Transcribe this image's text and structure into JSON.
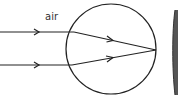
{
  "diagram": {
    "label_medium": "air",
    "colors": {
      "stroke": "#222222",
      "background": "#ffffff",
      "screen": "#555555"
    },
    "sphere": {
      "cx": 111,
      "cy": 49,
      "r": 45
    },
    "rays": [
      {
        "y": 32,
        "entry_x": 74,
        "focus": [
          156,
          50
        ]
      },
      {
        "y": 65,
        "entry_x": 72,
        "focus": [
          156,
          50
        ]
      }
    ]
  }
}
